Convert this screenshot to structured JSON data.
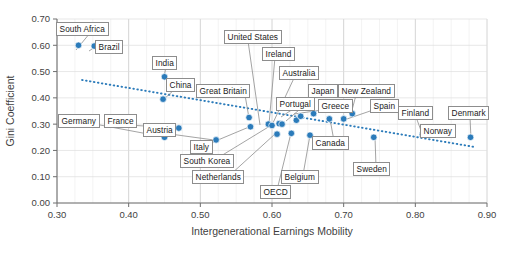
{
  "chart_data": {
    "type": "scatter",
    "title": "",
    "xlabel": "Intergenerational Earnings Mobility",
    "ylabel": "Gini Coefficient",
    "xlim": [
      0.3,
      0.9
    ],
    "ylim": [
      0.0,
      0.7
    ],
    "xticks": [
      "0.30",
      "0.40",
      "0.50",
      "0.60",
      "0.70",
      "0.80",
      "0.90"
    ],
    "yticks": [
      "0.00",
      "0.10",
      "0.20",
      "0.30",
      "0.40",
      "0.50",
      "0.60",
      "0.70"
    ],
    "grid": true,
    "legend": "none",
    "marker_color": "#2b7bba",
    "trendline": {
      "type": "dotted-linear",
      "color": "#2b7bba",
      "x_start": 0.335,
      "y_start": 0.468,
      "x_end": 0.885,
      "y_end": 0.212
    },
    "points": [
      {
        "label": "South Africa",
        "x": 0.33,
        "y": 0.6
      },
      {
        "label": "Brazil",
        "x": 0.352,
        "y": 0.597
      },
      {
        "label": "India",
        "x": 0.45,
        "y": 0.48
      },
      {
        "label": "China",
        "x": 0.448,
        "y": 0.395
      },
      {
        "label": "Germany",
        "x": 0.45,
        "y": 0.25
      },
      {
        "label": "France",
        "x": 0.47,
        "y": 0.285
      },
      {
        "label": "Austria",
        "x": 0.522,
        "y": 0.24
      },
      {
        "label": "Great Britain",
        "x": 0.568,
        "y": 0.325
      },
      {
        "label": "Italy",
        "x": 0.57,
        "y": 0.29
      },
      {
        "label": "United States",
        "x": 0.595,
        "y": 0.3
      },
      {
        "label": "South Korea",
        "x": 0.6,
        "y": 0.295
      },
      {
        "label": "Ireland",
        "x": 0.61,
        "y": 0.302
      },
      {
        "label": "Netherlands",
        "x": 0.607,
        "y": 0.262
      },
      {
        "label": "Australia",
        "x": 0.614,
        "y": 0.3
      },
      {
        "label": "OECD",
        "x": 0.627,
        "y": 0.265
      },
      {
        "label": "Japan",
        "x": 0.634,
        "y": 0.315
      },
      {
        "label": "Portugal",
        "x": 0.64,
        "y": 0.33
      },
      {
        "label": "Belgium",
        "x": 0.653,
        "y": 0.258
      },
      {
        "label": "Greece",
        "x": 0.658,
        "y": 0.34
      },
      {
        "label": "Canada",
        "x": 0.68,
        "y": 0.32
      },
      {
        "label": "Spain",
        "x": 0.7,
        "y": 0.32
      },
      {
        "label": "New Zealand",
        "x": 0.712,
        "y": 0.34
      },
      {
        "label": "Sweden",
        "x": 0.742,
        "y": 0.25
      },
      {
        "label": "Finland",
        "x": 0.81,
        "y": 0.26
      },
      {
        "label": "Norway",
        "x": 0.84,
        "y": 0.26
      },
      {
        "label": "Denmark",
        "x": 0.877,
        "y": 0.25
      }
    ],
    "labels": [
      {
        "text": "South Africa",
        "left": 56,
        "top": 22,
        "px": 76,
        "py": 50,
        "lx": 90,
        "ly": 33
      },
      {
        "text": "Brazil",
        "left": 95,
        "top": 40,
        "px": 89,
        "py": 51,
        "lx": 95,
        "ly": 47
      },
      {
        "text": "India",
        "left": 152,
        "top": 56,
        "px": 164,
        "py": 77,
        "lx": 166,
        "ly": 67
      },
      {
        "text": "China",
        "left": 166,
        "top": 78,
        "px": 163,
        "py": 100,
        "lx": 175,
        "ly": 89
      },
      {
        "text": "Great Britain",
        "left": 196,
        "top": 84,
        "px": 249,
        "py": 118,
        "lx": 245,
        "ly": 95
      },
      {
        "text": "United States",
        "left": 224,
        "top": 30,
        "px": 260,
        "py": 125,
        "lx": 248,
        "ly": 41
      },
      {
        "text": "Ireland",
        "left": 262,
        "top": 47,
        "px": 269,
        "py": 124,
        "lx": 275,
        "ly": 57
      },
      {
        "text": "Australia",
        "left": 279,
        "top": 66,
        "px": 272,
        "py": 125,
        "lx": 295,
        "ly": 76
      },
      {
        "text": "Japan",
        "left": 308,
        "top": 84,
        "px": 286,
        "py": 121,
        "lx": 318,
        "ly": 94
      },
      {
        "text": "Portugal",
        "left": 276,
        "top": 97,
        "px": 281,
        "py": 117,
        "lx": 296,
        "ly": 107
      },
      {
        "text": "Greece",
        "left": 318,
        "top": 99,
        "px": 294,
        "py": 114,
        "lx": 329,
        "ly": 109
      },
      {
        "text": "New Zealand",
        "left": 338,
        "top": 84,
        "px": 351,
        "py": 114,
        "lx": 356,
        "ly": 95
      },
      {
        "text": "Spain",
        "left": 370,
        "top": 99,
        "px": 344,
        "py": 120,
        "lx": 376,
        "ly": 109
      },
      {
        "text": "Finland",
        "left": 398,
        "top": 106,
        "px": 423,
        "py": 136,
        "lx": 416,
        "ly": 117
      },
      {
        "text": "Denmark",
        "left": 448,
        "top": 106,
        "px": 471,
        "py": 139,
        "lx": 470,
        "ly": 117
      },
      {
        "text": "Norway",
        "left": 420,
        "top": 124,
        "px": 444,
        "py": 136,
        "lx": 436,
        "ly": 134
      },
      {
        "text": "Germany",
        "left": 58,
        "top": 114,
        "px": 164,
        "py": 137,
        "lx": 100,
        "ly": 125
      },
      {
        "text": "France",
        "left": 104,
        "top": 114,
        "px": 177,
        "py": 128,
        "lx": 128,
        "ly": 125
      },
      {
        "text": "Austria",
        "left": 143,
        "top": 123,
        "px": 214,
        "py": 140,
        "lx": 170,
        "ly": 134
      },
      {
        "text": "Italy",
        "left": 190,
        "top": 140,
        "px": 249,
        "py": 127,
        "lx": 206,
        "ly": 145
      },
      {
        "text": "South Korea",
        "left": 180,
        "top": 154,
        "px": 270,
        "py": 126,
        "lx": 216,
        "ly": 159
      },
      {
        "text": "Canada",
        "left": 312,
        "top": 136,
        "px": 330,
        "py": 119,
        "lx": 334,
        "ly": 141
      },
      {
        "text": "Sweden",
        "left": 353,
        "top": 162,
        "px": 375,
        "py": 137,
        "lx": 376,
        "ly": 167
      },
      {
        "text": "Netherlands",
        "left": 192,
        "top": 170,
        "px": 275,
        "py": 134,
        "lx": 230,
        "ly": 175
      },
      {
        "text": "Belgium",
        "left": 281,
        "top": 170,
        "px": 310,
        "py": 135,
        "lx": 303,
        "ly": 175
      },
      {
        "text": "OECD",
        "left": 260,
        "top": 185,
        "px": 291,
        "py": 133,
        "lx": 277,
        "ly": 190
      }
    ]
  }
}
